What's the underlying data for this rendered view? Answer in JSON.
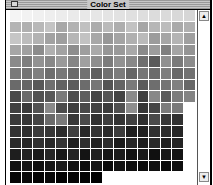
{
  "window": {
    "title": "Color Set",
    "close_box_icon": "close-box"
  },
  "scrollbar": {
    "up_arrow": "▲",
    "down_arrow": "▼"
  },
  "palette": {
    "columns": 16,
    "row_counts": [
      16,
      16,
      16,
      16,
      16,
      16,
      16,
      16,
      15,
      15,
      15,
      15,
      15,
      15,
      8
    ],
    "rows": [
      [
        "#f4f4f4",
        "#f2f2f2",
        "#f0f0f0",
        "#eeeeee",
        "#ececec",
        "#eaeaea",
        "#e8e8e8",
        "#e6e6e6",
        "#e4e4e4",
        "#e2e2e2",
        "#e0e0e0",
        "#dedede",
        "#dcdcdc",
        "#dadada",
        "#d8d8d8",
        "#d6d6d6"
      ],
      [
        "#b4b4b4",
        "#b0b0b0",
        "#b8b8b8",
        "#c4c4c4",
        "#a8a8a8",
        "#b2b2b2",
        "#c0c0c0",
        "#acacac",
        "#bababa",
        "#aeaeae",
        "#c2c2c2",
        "#a6a6a6",
        "#b6b6b6",
        "#bcbcbc",
        "#aaaaaa",
        "#b0b0b0"
      ],
      [
        "#c6c6c6",
        "#bcbcbc",
        "#b2b2b2",
        "#a2a2a2",
        "#9e9e9e",
        "#b6b6b6",
        "#c2c2c2",
        "#a8a8a8",
        "#989898",
        "#a4a4a4",
        "#b0b0b0",
        "#bababa",
        "#9c9c9c",
        "#a6a6a6",
        "#b4b4b4",
        "#a0a0a0"
      ],
      [
        "#a6a6a6",
        "#a0a0a0",
        "#8c8c8c",
        "#b0b0b0",
        "#a2a2a2",
        "#8e8e8e",
        "#9e9e9e",
        "#aaaaaa",
        "#969696",
        "#9a9a9a",
        "#a8a8a8",
        "#8a8a8a",
        "#9c9c9c",
        "#808080",
        "#a4a4a4",
        "#949494"
      ],
      [
        "#8a8a8a",
        "#7e7e7e",
        "#929292",
        "#888888",
        "#9a9a9a",
        "#868686",
        "#a0a0a0",
        "#8e8e8e",
        "#7c7c7c",
        "#929292",
        "#888888",
        "#6e6e6e",
        "#5a5a5a",
        "#909090",
        "#7a7a7a",
        "#8c8c8c"
      ],
      [
        "#7a7a7a",
        "#747474",
        "#808080",
        "#6e6e6e",
        "#787878",
        "#6a6a6a",
        "#727272",
        "#5e5e5e",
        "#707070",
        "#7c7c7c",
        "#666666",
        "#767676",
        "#6c6c6c",
        "#7e7e7e",
        "#686868",
        "#727272"
      ],
      [
        "#6a6a6a",
        "#666666",
        "#585858",
        "#707070",
        "#626262",
        "#5c5c5c",
        "#6c6c6c",
        "#767676",
        "#545454",
        "#646464",
        "#7a7a7a",
        "#5a5a5a",
        "#6e6e6e",
        "#747474",
        "#808080",
        "#686868"
      ],
      [
        "#4a4a4a",
        "#6a6a6a",
        "#525252",
        "#585858",
        "#7a7a7a",
        "#4e4e4e",
        "#5e5e5e",
        "#464646",
        "#565656",
        "#444444",
        "#8a8a8a",
        "#3e3e3e",
        "#888888",
        "#5a5a5a",
        "#7c7c7c",
        "#848484"
      ],
      [
        "#404040",
        "#3a3a3a",
        "#525252",
        "#8a8a8a",
        "#4c4c4c",
        "#3e3e3e",
        "#484848",
        "#424242",
        "#3c3c3c",
        "#505050",
        "#8e8e8e",
        "#363636",
        "#464646",
        "#7c7c7c",
        "#7a7a7a"
      ],
      [
        "#3a3a3a",
        "#363636",
        "#444444",
        "#6a6a6a",
        "#7a7a7a",
        "#383838",
        "#4a4a4a",
        "#323232",
        "#3e3e3e",
        "#343434",
        "#404040",
        "#2e2e2e",
        "#4a4a4a",
        "#383838",
        "#323232"
      ],
      [
        "#323232",
        "#2e2e2e",
        "#3a3a3a",
        "#363636",
        "#2c2c2c",
        "#404040",
        "#282828",
        "#343434",
        "#2a2a2a",
        "#3c3c3c",
        "#1e1e1e",
        "#202020",
        "#303030",
        "#2c2c2c",
        "#262626"
      ],
      [
        "#2a2a2a",
        "#262626",
        "#303030",
        "#282828",
        "#343434",
        "#1e1e1e",
        "#2e2e2e",
        "#222222",
        "#2c2c2c",
        "#1a1a1a",
        "#262626",
        "#1c1c1c",
        "#2a2a2a",
        "#1e1e1e",
        "#242424"
      ],
      [
        "#1e1e1e",
        "#222222",
        "#1a1a1a",
        "#262626",
        "#181818",
        "#242424",
        "#141414",
        "#202020",
        "#161616",
        "#1c1c1c",
        "#121212",
        "#1a1a1a",
        "#101010",
        "#181818",
        "#141414"
      ],
      [
        "#121212",
        "#161616",
        "#0e0e0e",
        "#141414",
        "#1a1a1a",
        "#101010",
        "#0c0c0c",
        "#141414",
        "#0a0a0a",
        "#121212",
        "#0e0e0e",
        "#0c0c0c",
        "#101010",
        "#080808",
        "#0e0e0e"
      ],
      [
        "#060606",
        "#0a0a0a",
        "#040404",
        "#080808",
        "#020202",
        "#060606",
        "#040404",
        "#000000"
      ]
    ]
  }
}
